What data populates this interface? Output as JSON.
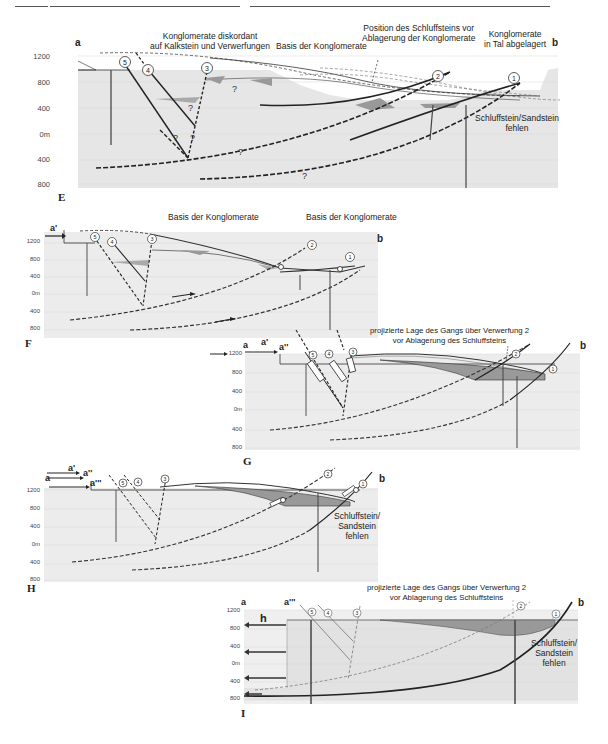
{
  "header": {
    "rule_segments": 3
  },
  "panels": [
    {
      "id": "E",
      "label": "E",
      "left_end": "a",
      "right_end": "b",
      "y_ticks": [
        "1200",
        "800",
        "400",
        "0m",
        "400",
        "800"
      ],
      "annotations": {
        "discordant": [
          "Konglomerate diskordant",
          "auf Kalkstein und Verwerfungen"
        ],
        "basis": "Basis der Konglomerate",
        "position": [
          "Position des Schluffsteins vor",
          "Ablagerung der Konglomerate"
        ],
        "valley": [
          "Konglomerate",
          "in Tal abgelagert"
        ],
        "missing": [
          "Schluffstein/Sandstein",
          "fehlen"
        ]
      },
      "faults": [
        "5",
        "4",
        "3",
        "2",
        "1"
      ],
      "uncertain_mark": "?"
    },
    {
      "id": "F",
      "label": "F",
      "left_end": "a'",
      "right_end": "b",
      "y_ticks": [
        "1200",
        "800",
        "400",
        "0m",
        "400",
        "800"
      ],
      "annotations": {
        "basis_left": "Basis der Konglomerate",
        "basis_right": "Basis der Konglomerate"
      },
      "faults": [
        "5",
        "4",
        "3",
        "2",
        "1"
      ]
    },
    {
      "id": "G",
      "label": "G",
      "left_ends": [
        "a",
        "a'",
        "a''"
      ],
      "right_end": "b",
      "y_ticks": [
        "1200",
        "800",
        "400",
        "0m",
        "400",
        "800"
      ],
      "annotations": {
        "projected": [
          "projizierte Lage des Gangs über Verwerfung 2",
          "vor Ablagerung des Schluffsteins"
        ]
      },
      "faults": [
        "5",
        "4",
        "3",
        "2",
        "1"
      ]
    },
    {
      "id": "H",
      "label": "H",
      "left_ends": [
        "a",
        "a'",
        "a''",
        "a'''"
      ],
      "right_end": "b",
      "y_ticks": [
        "1200",
        "800",
        "400",
        "0m",
        "400",
        "800"
      ],
      "annotations": {
        "missing": [
          "Schluffstein/",
          "Sandstein",
          "fehlen"
        ]
      },
      "faults": [
        "5",
        "4",
        "3",
        "2",
        "1"
      ]
    },
    {
      "id": "I",
      "label": "I",
      "left_ends": [
        "a",
        "a'''"
      ],
      "right_end": "b",
      "extension_label": "h",
      "y_ticks": [
        "1200",
        "800",
        "400",
        "0m",
        "400",
        "800"
      ],
      "annotations": {
        "projected": [
          "projizierte Lage des Gangs über Verwerfung 2",
          "vor Ablagerung des Schluffsteins"
        ],
        "missing": [
          "Schluffstein/",
          "Sandstein",
          "fehlen"
        ]
      },
      "faults": [
        "5",
        "4",
        "3",
        "2",
        "1"
      ]
    }
  ],
  "colors": {
    "bedrock": "#e4e4e4",
    "conglomerate": "#9a9a9a",
    "line": "#2a2a2a",
    "grid": "#d2d2d2"
  }
}
